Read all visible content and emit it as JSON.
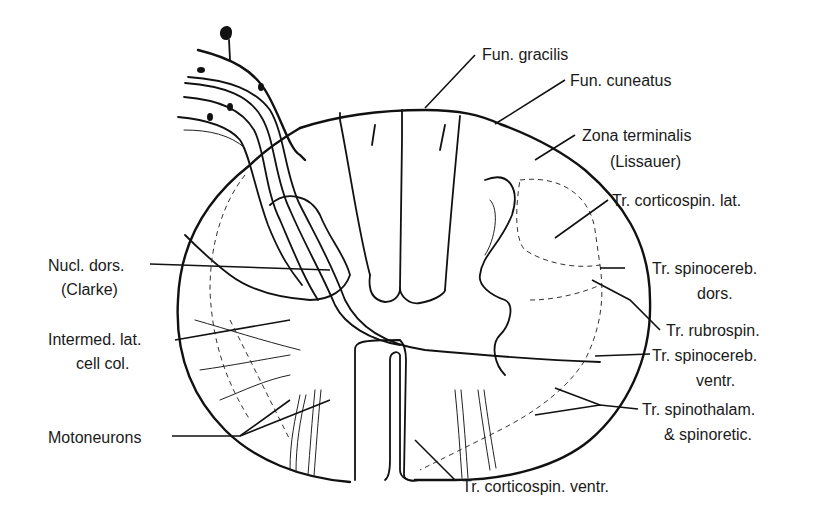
{
  "figure": {
    "labels": {
      "fun_gracilis": "Fun. gracilis",
      "fun_cuneatus": "Fun. cuneatus",
      "zona_terminalis_1": "Zona terminalis",
      "zona_terminalis_2": "(Lissauer)",
      "tr_corticospin_lat": "Tr. corticospin. lat.",
      "tr_spinocereb_dors_1": "Tr. spinocereb.",
      "tr_spinocereb_dors_2": "dors.",
      "tr_rubrospin": "Tr. rubrospin.",
      "tr_spinocereb_ventr_1": "Tr. spinocereb.",
      "tr_spinocereb_ventr_2": "ventr.",
      "tr_spinothalam_1": "Tr. spinothalam.",
      "tr_spinothalam_2": "& spinoretic.",
      "tr_corticospin_ventr": "Tr. corticospin. ventr.",
      "nucl_dors_1": "Nucl. dors.",
      "nucl_dors_2": "(Clarke)",
      "intermed_lat_1": "Intermed. lat.",
      "intermed_lat_2": "cell col.",
      "motoneurons": "Motoneurons"
    }
  }
}
